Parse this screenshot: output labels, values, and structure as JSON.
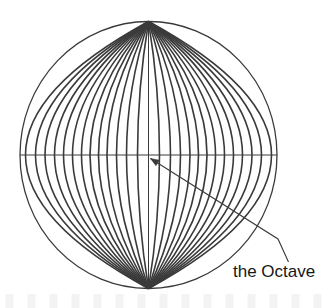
{
  "figure": {
    "kind": "concentric-vesica-diagram",
    "background_color": "#ffffff",
    "stroke_color": "#3a3a3a",
    "text_color": "#171717",
    "canvas": {
      "width": 333,
      "height": 308
    }
  },
  "circle": {
    "label": "outer-circle",
    "center_x": 148.5,
    "center_y": 155,
    "radius_x": 128.5,
    "radius_y": 133.5,
    "stroke_width": 1.3
  },
  "axes": {
    "horizontal": {
      "label": "horizontal-axis",
      "x1": 20,
      "y1": 155,
      "x2": 277,
      "y2": 155
    },
    "vertical": {
      "label": "vertical-axis",
      "x1": 148.5,
      "y1": 21.5,
      "x2": 148.5,
      "y2": 288.5
    }
  },
  "lens_curves": {
    "label": "nested-vesica-curves",
    "count": 13,
    "pole_top_y": 21.5,
    "pole_bottom_y": 288.5,
    "half_widths": [
      123,
      113,
      103.5,
      94,
      85,
      76,
      67,
      58.5,
      50,
      41.5,
      32,
      22,
      11
    ],
    "stroke_width": 1.6,
    "note": "each curve is a lens (vesica) passing through the top and bottom poles of the circle, symmetric about the vertical axis"
  },
  "leader": {
    "label": "leader-line",
    "points": [
      {
        "x": 150.5,
        "y": 158.5
      },
      {
        "x": 278,
        "y": 239
      },
      {
        "x": 288.5,
        "y": 262
      }
    ],
    "arrow_head": {
      "x": 150.5,
      "y": 158.5,
      "angle_deg": 212
    },
    "stroke_width": 1.1
  },
  "annotation": {
    "label_text": "the Octave",
    "x": 233,
    "y": 277,
    "font_size": 17
  }
}
